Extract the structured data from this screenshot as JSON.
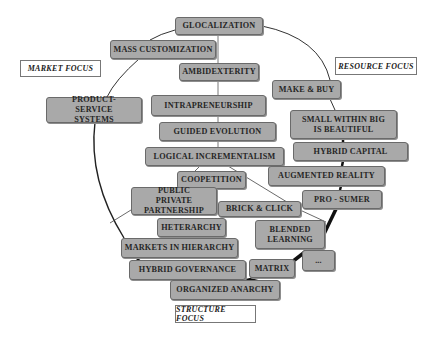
{
  "focus_labels": {
    "market": "MARKET FOCUS",
    "resource": "RESOURCE FOCUS",
    "structure": "STRUCTURE FOCUS"
  },
  "nodes": {
    "glocalization": "GLOCALIZATION",
    "mass_customization": "MASS CUSTOMIZATION",
    "ambidexterity": "AMBIDEXTERITY",
    "product_service_systems": "PRODUCT-SERVICE SYSTEMS",
    "intrapreneurship": "INTRAPRENEURSHIP",
    "guided_evolution": "GUIDED EVOLUTION",
    "logical_incrementalism": "LOGICAL INCREMENTALISM",
    "make_and_buy": "MAKE & BUY",
    "small_within_big": "SMALL WITHIN BIG IS BEAUTIFUL",
    "hybrid_capital": "HYBRID CAPITAL",
    "augmented_reality": "AUGMENTED REALITY",
    "pro_sumer": "PRO - SUMER",
    "coopetition": "COOPETITION",
    "public_private_partnership": "PUBLIC PRIVATE PARTNERSHIP",
    "brick_and_click": "BRICK & CLICK",
    "heterarchy": "HETERARCHY",
    "blended_learning": "BLENDED LEARNING",
    "markets_in_hierarchy": "MARKETS IN HIERARCHY",
    "hybrid_governance": "HYBRID GOVERNANCE",
    "matrix": "MATRIX",
    "ellipsis": "...",
    "organized_anarchy": "ORGANIZED ANARCHY"
  },
  "colors": {
    "node_fill": "#a9a9a9",
    "node_border": "#6a6a6a",
    "line": "#333333"
  }
}
